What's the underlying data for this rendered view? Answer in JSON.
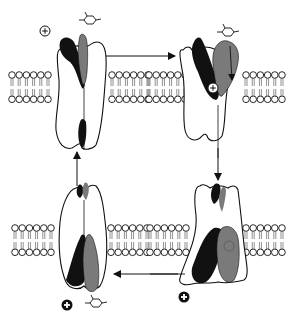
{
  "figure": {
    "title": "Transporter alternating-access cycle (symport of cation and substrate)",
    "colors": {
      "background": "#ffffff",
      "outline": "#111111",
      "domain_black": "#111111",
      "domain_gray": "#7a7a7a",
      "lipid_head": "#ffffff"
    },
    "panels": [
      {
        "id": "top-left",
        "state": "outward-open, empty",
        "ion": "outside",
        "substrate": "outside"
      },
      {
        "id": "top-right",
        "state": "outward-open, ion and substrate bound",
        "ion": "bound",
        "substrate": "binding"
      },
      {
        "id": "bottom-right",
        "state": "inward-open, occluded",
        "ion": "released inside",
        "substrate": "bound"
      },
      {
        "id": "bottom-left",
        "state": "inward-open, ion and substrate released",
        "ion": "inside",
        "substrate": "inside"
      }
    ],
    "symbols": {
      "ion": "positive-cation",
      "ion_glyph": "+",
      "substrate": "substrate-molecule"
    },
    "arrows": [
      {
        "from": "top-left",
        "to": "top-right",
        "direction": "right"
      },
      {
        "from": "top-right",
        "to": "bottom-right",
        "direction": "down"
      },
      {
        "from": "bottom-right",
        "to": "bottom-left",
        "direction": "left"
      },
      {
        "from": "bottom-left",
        "to": "top-left",
        "direction": "up"
      }
    ]
  }
}
